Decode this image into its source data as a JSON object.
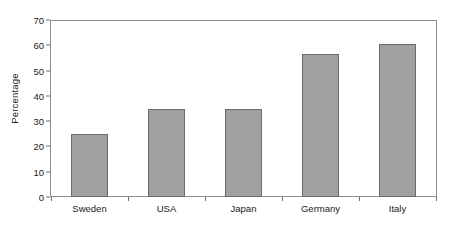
{
  "chart_data": {
    "type": "bar",
    "title": "",
    "subtitle": "",
    "xlabel": "",
    "ylabel": "Percentage",
    "categories": [
      "Sweden",
      "USA",
      "Japan",
      "Germany",
      "Italy"
    ],
    "values": [
      25,
      35,
      35,
      57,
      61
    ],
    "ylim": [
      0,
      70
    ],
    "y_ticks": [
      0,
      10,
      20,
      30,
      40,
      50,
      60,
      70
    ],
    "y_tick_labels": [
      "0",
      "10",
      "20",
      "30",
      "40",
      "50",
      "60",
      "70"
    ],
    "grid": false,
    "legend": null,
    "legend_position": "none",
    "annotations": [],
    "colors": {
      "bar_fill": "#a0a0a0",
      "bar_border": "#6b6b6b",
      "frame": "#8c8c8c",
      "text": "#1a1a1a",
      "background": "#ffffff"
    }
  }
}
